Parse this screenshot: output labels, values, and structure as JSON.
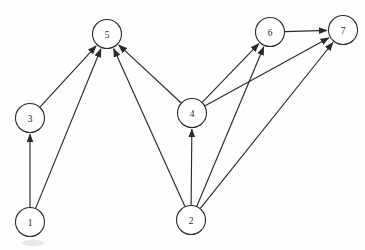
{
  "figure": {
    "background_color": "#fefefe",
    "ink_color": "#2a2a2a",
    "node_fill": "#ffffff",
    "node_radius": 14.5
  },
  "graph_data": {
    "type": "diagram",
    "graph_type": "directed-graph",
    "directed": true,
    "node_count": 7,
    "edge_count": 11,
    "nodes": [
      {
        "id": "1",
        "label": "1",
        "x": 30,
        "y": 222
      },
      {
        "id": "2",
        "label": "2",
        "x": 191,
        "y": 220
      },
      {
        "id": "3",
        "label": "3",
        "x": 30,
        "y": 118
      },
      {
        "id": "4",
        "label": "4",
        "x": 192,
        "y": 113
      },
      {
        "id": "5",
        "label": "5",
        "x": 107,
        "y": 34
      },
      {
        "id": "6",
        "label": "6",
        "x": 270,
        "y": 32
      },
      {
        "id": "7",
        "label": "7",
        "x": 343,
        "y": 30
      }
    ],
    "edges": [
      {
        "from": "1",
        "to": "3",
        "arrow": "to"
      },
      {
        "from": "1",
        "to": "5",
        "arrow": "to"
      },
      {
        "from": "3",
        "to": "5",
        "arrow": "to"
      },
      {
        "from": "2",
        "to": "5",
        "arrow": "to"
      },
      {
        "from": "2",
        "to": "4",
        "arrow": "to"
      },
      {
        "from": "2",
        "to": "6",
        "arrow": "to"
      },
      {
        "from": "2",
        "to": "7",
        "arrow": "to"
      },
      {
        "from": "4",
        "to": "5",
        "arrow": "to"
      },
      {
        "from": "4",
        "to": "6",
        "arrow": "to"
      },
      {
        "from": "4",
        "to": "7",
        "arrow": "to"
      },
      {
        "from": "6",
        "to": "7",
        "arrow": "to"
      }
    ],
    "adjacency": {
      "1": [
        "3",
        "5"
      ],
      "2": [
        "4",
        "5",
        "6",
        "7"
      ],
      "3": [
        "5"
      ],
      "4": [
        "5",
        "6",
        "7"
      ],
      "5": [],
      "6": [
        "7"
      ],
      "7": []
    },
    "in_degree": {
      "1": 0,
      "2": 0,
      "3": 1,
      "4": 1,
      "5": 4,
      "6": 2,
      "7": 3
    },
    "out_degree": {
      "1": 2,
      "2": 4,
      "3": 1,
      "4": 3,
      "5": 0,
      "6": 1,
      "7": 0
    },
    "source_nodes": [
      "1",
      "2"
    ],
    "sink_nodes": [
      "5",
      "7"
    ]
  }
}
